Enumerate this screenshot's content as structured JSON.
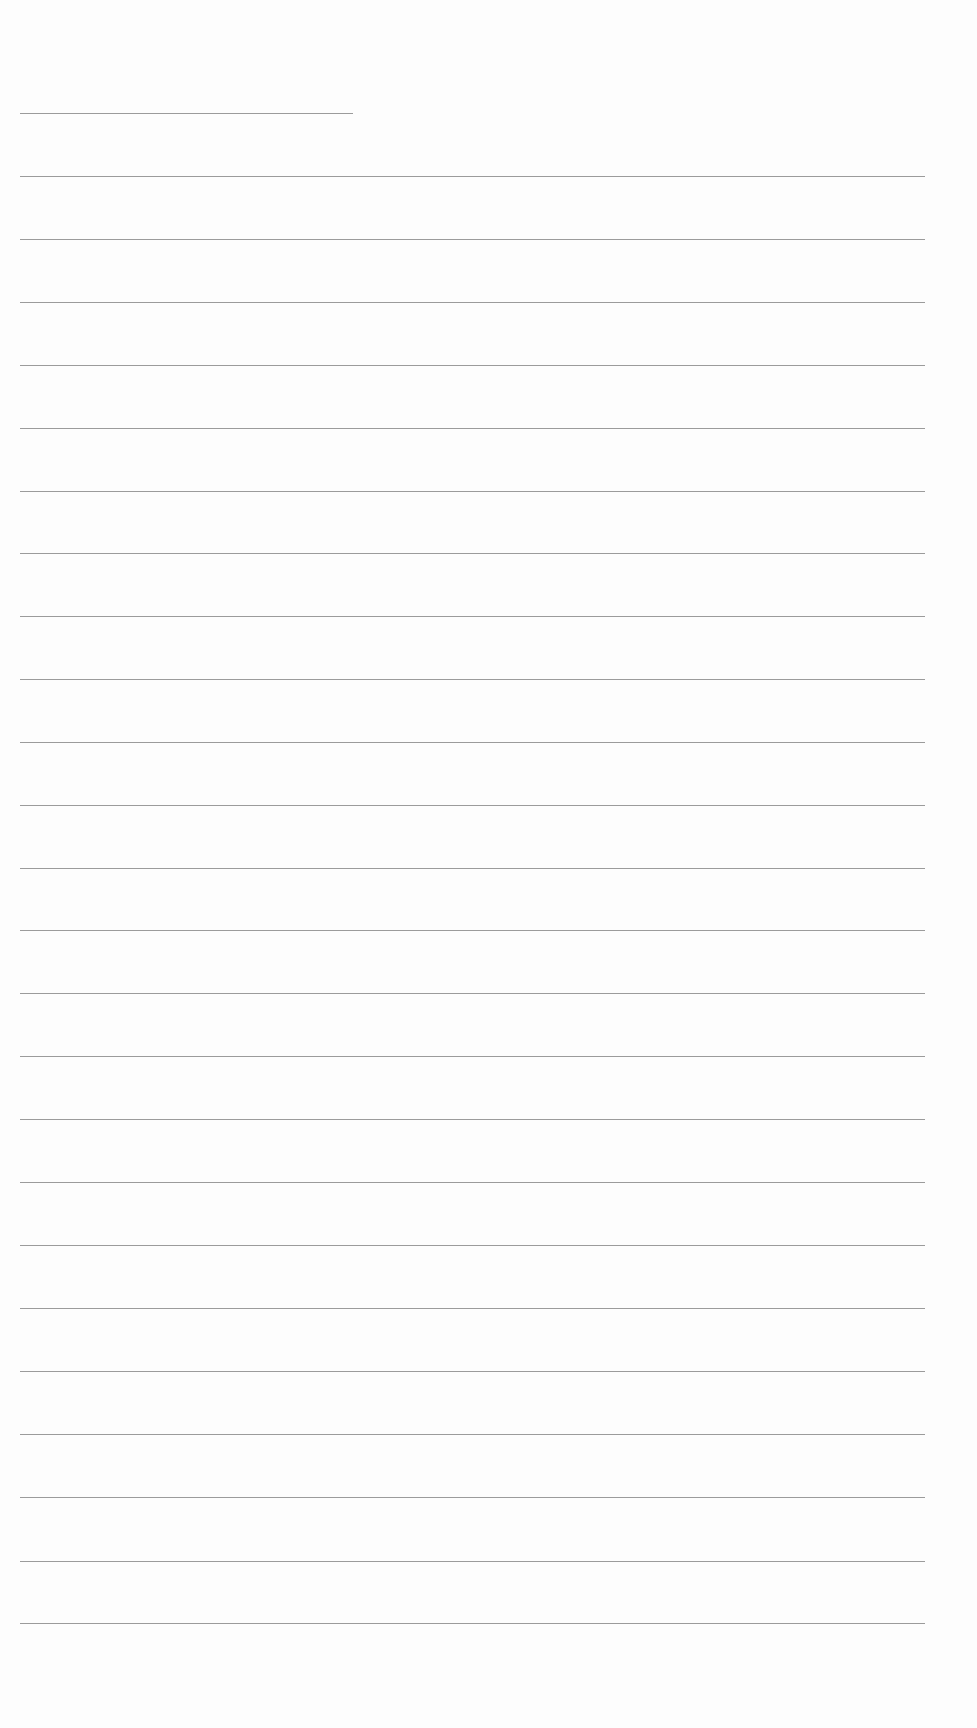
{
  "page": {
    "type": "blank lined paper",
    "background_color": "#fdfdfd",
    "rule_color": "#8a8a8a"
  },
  "header_rule": {
    "y": 113,
    "x_start": 20,
    "x_end": 353
  },
  "body_rules": {
    "x_start": 20,
    "x_end": 925,
    "spacing": 62.9,
    "positions_y": [
      176,
      239,
      302,
      365,
      428,
      491,
      553,
      616,
      679,
      742,
      805,
      868,
      930,
      993,
      1056,
      1119,
      1182,
      1245,
      1308,
      1371,
      1434,
      1497,
      1561,
      1623
    ]
  }
}
